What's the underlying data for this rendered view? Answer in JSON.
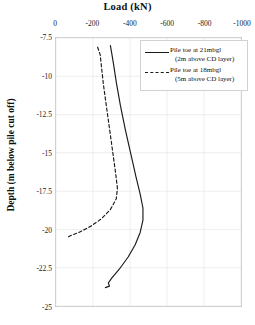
{
  "chart_data": {
    "type": "line",
    "title": "Load (kN)",
    "xlabel": "Load (kN)",
    "ylabel": "Depth (m below pile cut off)",
    "xlim": [
      0,
      -1000
    ],
    "ylim": [
      -7.5,
      -25
    ],
    "xticks": [
      "0",
      "-200",
      "-400",
      "-600",
      "-800",
      "-1000"
    ],
    "xtick_values": [
      0,
      -200,
      -400,
      -600,
      -800,
      -1000
    ],
    "yticks": [
      "-7.5",
      "-10",
      "-12.5",
      "-15",
      "-17.5",
      "-20",
      "-22.5",
      "-25"
    ],
    "ytick_values": [
      -7.5,
      -10,
      -12.5,
      -15,
      -17.5,
      -20,
      -22.5,
      -25
    ],
    "grid": true,
    "legend_position": "top-right",
    "series": [
      {
        "name": "Pile toe at 21mbgl (2m above CD layer)",
        "label_line1": "Pile toe at 21mbgl",
        "label_line2": "(2m above CD layer)",
        "style": "solid",
        "color": "#1a1a1a",
        "points": [
          {
            "load": -294,
            "depth": -8.0
          },
          {
            "load": -300,
            "depth": -8.4
          },
          {
            "load": -311,
            "depth": -9.2
          },
          {
            "load": -326,
            "depth": -10.4
          },
          {
            "load": -348,
            "depth": -11.9
          },
          {
            "load": -375,
            "depth": -13.5
          },
          {
            "load": -405,
            "depth": -15.1
          },
          {
            "load": -433,
            "depth": -16.6
          },
          {
            "load": -455,
            "depth": -17.7
          },
          {
            "load": -470,
            "depth": -18.6
          },
          {
            "load": -470,
            "depth": -19.4
          },
          {
            "load": -455,
            "depth": -20.2
          },
          {
            "load": -428,
            "depth": -21.0
          },
          {
            "load": -390,
            "depth": -21.8
          },
          {
            "load": -342,
            "depth": -22.6
          },
          {
            "load": -300,
            "depth": -23.2
          },
          {
            "load": -283,
            "depth": -23.5
          },
          {
            "load": -289,
            "depth": -23.7
          },
          {
            "load": -267,
            "depth": -23.8
          }
        ]
      },
      {
        "name": "Pile toe at 18mbgl (5m above CD layer)",
        "label_line1": "Pile toe at 18mbgl",
        "label_line2": "(5m above CD layer)",
        "style": "dashed",
        "color": "#1a1a1a",
        "points": [
          {
            "load": -225,
            "depth": -8.1
          },
          {
            "load": -239,
            "depth": -8.6
          },
          {
            "load": -246,
            "depth": -9.4
          },
          {
            "load": -257,
            "depth": -10.6
          },
          {
            "load": -273,
            "depth": -12.0
          },
          {
            "load": -289,
            "depth": -13.4
          },
          {
            "load": -305,
            "depth": -14.8
          },
          {
            "load": -321,
            "depth": -16.2
          },
          {
            "load": -332,
            "depth": -17.3
          },
          {
            "load": -326,
            "depth": -18.0
          },
          {
            "load": -294,
            "depth": -18.7
          },
          {
            "load": -246,
            "depth": -19.3
          },
          {
            "load": -187,
            "depth": -19.8
          },
          {
            "load": -123,
            "depth": -20.2
          },
          {
            "load": -80,
            "depth": -20.4
          },
          {
            "load": -64,
            "depth": -20.5
          }
        ]
      }
    ]
  },
  "caption": {
    "text": ""
  }
}
